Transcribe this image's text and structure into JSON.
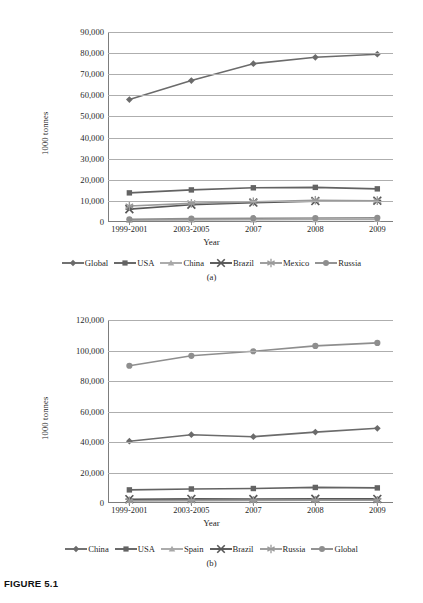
{
  "figure": {
    "caption": "FIGURE 5.1",
    "panel_a_caption": "(a)",
    "panel_b_caption": "(b)"
  },
  "chart_data": [
    {
      "id": "panel-a",
      "type": "line",
      "title": "",
      "xlabel": "Year",
      "ylabel": "1000 tonnes",
      "categories": [
        "1999-2001",
        "2003-2005",
        "2007",
        "2008",
        "2009"
      ],
      "ylim": [
        0,
        90000
      ],
      "ytick_step": 10000,
      "ytick_labels": [
        "0",
        "10,000",
        "20,000",
        "30,000",
        "40,000",
        "50,000",
        "60,000",
        "70,000",
        "80,000",
        "90,000"
      ],
      "grid": true,
      "legend_position": "bottom",
      "series": [
        {
          "name": "Global",
          "marker": "diamond",
          "color": "#6b6b6b",
          "values": [
            58000,
            67000,
            75000,
            78000,
            79500
          ]
        },
        {
          "name": "USA",
          "marker": "square",
          "color": "#636363",
          "values": [
            13800,
            15200,
            16200,
            16400,
            15700
          ]
        },
        {
          "name": "China",
          "marker": "triangle",
          "color": "#a8a8a8",
          "values": [
            900,
            1000,
            1100,
            1200,
            1250
          ]
        },
        {
          "name": "Brazil",
          "marker": "cross",
          "color": "#575757",
          "values": [
            6100,
            8200,
            9200,
            9900,
            10100
          ]
        },
        {
          "name": "Mexico",
          "marker": "star",
          "color": "#9a9a9a",
          "values": [
            7600,
            8800,
            9600,
            10300,
            10100
          ]
        },
        {
          "name": "Russia",
          "marker": "circle",
          "color": "#8e8e8e",
          "values": [
            1300,
            1600,
            1800,
            1900,
            2000
          ]
        }
      ]
    },
    {
      "id": "panel-b",
      "type": "line",
      "title": "",
      "xlabel": "Year",
      "ylabel": "1000 tonnes",
      "categories": [
        "1999-2001",
        "2003-2005",
        "2007",
        "2008",
        "2009"
      ],
      "ylim": [
        0,
        120000
      ],
      "ytick_step": 20000,
      "ytick_labels": [
        "0",
        "20,000",
        "40,000",
        "60,000",
        "80,000",
        "100,000",
        "120,000"
      ],
      "grid": true,
      "legend_position": "bottom",
      "series": [
        {
          "name": "China",
          "marker": "diamond",
          "color": "#6b6b6b",
          "values": [
            40500,
            44800,
            43500,
            46500,
            49000
          ]
        },
        {
          "name": "USA",
          "marker": "square",
          "color": "#636363",
          "values": [
            8600,
            9200,
            9500,
            10200,
            9900
          ]
        },
        {
          "name": "Spain",
          "marker": "triangle",
          "color": "#a8a8a8",
          "values": [
            2100,
            2300,
            2200,
            2400,
            2300
          ]
        },
        {
          "name": "Brazil",
          "marker": "cross",
          "color": "#575757",
          "values": [
            2500,
            2700,
            2600,
            2800,
            2700
          ]
        },
        {
          "name": "Russia",
          "marker": "star",
          "color": "#9a9a9a",
          "values": [
            1400,
            1600,
            1700,
            1800,
            1800
          ]
        },
        {
          "name": "Global",
          "marker": "circle",
          "color": "#8e8e8e",
          "values": [
            90000,
            96500,
            99500,
            103000,
            105000
          ]
        }
      ]
    }
  ]
}
